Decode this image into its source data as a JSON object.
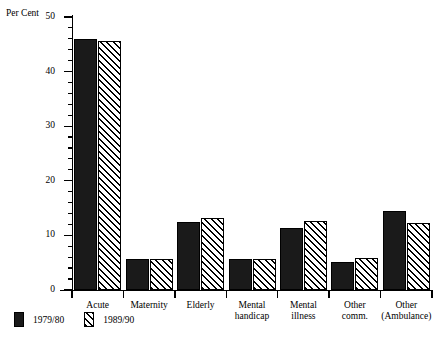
{
  "chart_data": {
    "type": "bar",
    "title": "",
    "xlabel": "",
    "ylabel": "Per Cent",
    "ylim": [
      0,
      50
    ],
    "ytick_major": [
      0,
      10,
      20,
      30,
      40,
      50
    ],
    "ytick_minor_step": 2,
    "grid": false,
    "legend_position": "below-left",
    "categories": [
      "Acute",
      "Maternity",
      "Elderly",
      "Mental\nhandicap",
      "Mental\nillness",
      "Other\ncomm.",
      "Other\n(Ambulance)"
    ],
    "series": [
      {
        "name": "1979/80",
        "fill": "solid-black",
        "values": [
          46.0,
          5.7,
          12.5,
          5.7,
          11.4,
          5.2,
          14.5
        ]
      },
      {
        "name": "1989/90",
        "fill": "diagonal-hatch",
        "values": [
          45.6,
          5.7,
          13.1,
          5.7,
          12.6,
          5.8,
          12.3
        ]
      }
    ]
  },
  "legend": {
    "entries": [
      {
        "label": "1979/80",
        "fill": "solid-black"
      },
      {
        "label": "1989/90",
        "fill": "diagonal-hatch"
      }
    ]
  },
  "colors": {
    "bar_solid": "#1a1a1a",
    "bar_hatch_line": "#000000",
    "background": "#ffffff",
    "axis": "#000000"
  }
}
